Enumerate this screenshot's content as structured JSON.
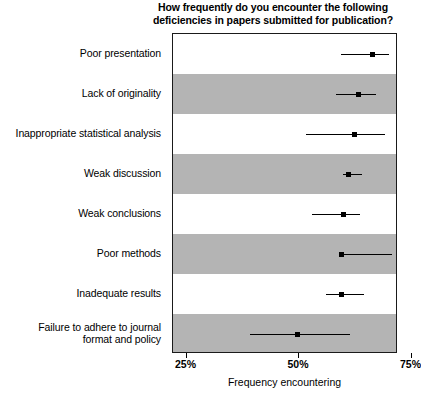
{
  "chart_data": {
    "type": "scatter",
    "title": "How frequently do you encounter the following deficiencies in papers submitted for publication?",
    "title_lines": [
      "How frequently do you encounter the following",
      "deficiencies in papers submitted for publication?"
    ],
    "xlabel": "Frequency encountering",
    "ylabel": "",
    "xlim": [
      22,
      72
    ],
    "xticks": [
      25,
      50,
      75
    ],
    "xticklabels": [
      "25%",
      "50%",
      "75%"
    ],
    "grid": false,
    "legend": null,
    "orientation": "horizontal",
    "marker_color": "#000000",
    "band_color": "#b4b4b4",
    "plot_bg": "#ffffff",
    "categories": [
      "Poor presentation",
      "Lack of originality",
      "Inappropriate statistical analysis",
      "Weak discussion",
      "Weak conclusions",
      "Poor methods",
      "Inadequate results",
      "Failure to adhere to journal format and policy"
    ],
    "category_lines": [
      [
        "Poor presentation"
      ],
      [
        "Lack of originality"
      ],
      [
        "Inappropriate statistical analysis"
      ],
      [
        "Weak discussion"
      ],
      [
        "Weak conclusions"
      ],
      [
        "Poor methods"
      ],
      [
        "Inadequate results"
      ],
      [
        "Failure to adhere to journal",
        "format and policy"
      ]
    ],
    "values": [
      66.4,
      63.3,
      62.3,
      60.9,
      59.9,
      59.5,
      59.5,
      49.6
    ],
    "ci_low": [
      59.4,
      58.3,
      51.6,
      59.7,
      52.8,
      59.0,
      55.9,
      39.1
    ],
    "ci_high": [
      70.0,
      67.1,
      69.2,
      64.0,
      63.5,
      70.7,
      64.5,
      61.4
    ],
    "points": [
      {
        "category": "Poor presentation",
        "value": 66.4,
        "ci_low": 59.4,
        "ci_high": 70.0,
        "shaded": false
      },
      {
        "category": "Lack of originality",
        "value": 63.3,
        "ci_low": 58.3,
        "ci_high": 67.1,
        "shaded": true
      },
      {
        "category": "Inappropriate statistical analysis",
        "value": 62.3,
        "ci_low": 51.6,
        "ci_high": 69.2,
        "shaded": false
      },
      {
        "category": "Weak discussion",
        "value": 60.9,
        "ci_low": 59.7,
        "ci_high": 64.0,
        "shaded": true
      },
      {
        "category": "Weak conclusions",
        "value": 59.9,
        "ci_low": 52.8,
        "ci_high": 63.5,
        "shaded": false
      },
      {
        "category": "Poor methods",
        "value": 59.5,
        "ci_low": 59.0,
        "ci_high": 70.7,
        "shaded": true
      },
      {
        "category": "Inadequate results",
        "value": 59.5,
        "ci_low": 55.9,
        "ci_high": 64.5,
        "shaded": false
      },
      {
        "category": "Failure to adhere to journal format and policy",
        "value": 49.6,
        "ci_low": 39.1,
        "ci_high": 61.4,
        "shaded": true
      }
    ]
  }
}
